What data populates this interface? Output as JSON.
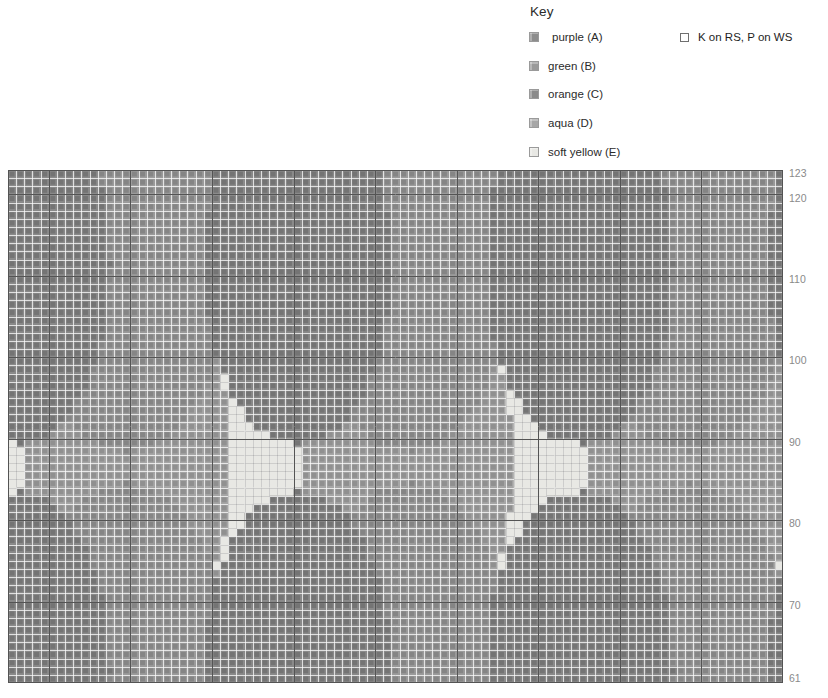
{
  "key": {
    "title": "Key",
    "colors": [
      {
        "label": "purple (A)",
        "letter": "A",
        "hex": "#8d8d8d",
        "indent": true
      },
      {
        "label": "green (B)",
        "letter": "B",
        "hex": "#9b9b9b",
        "indent": false
      },
      {
        "label": "orange (C)",
        "letter": "C",
        "hex": "#8a8a8a",
        "indent": false
      },
      {
        "label": "aqua (D)",
        "letter": "D",
        "hex": "#a6a6a6",
        "indent": false
      },
      {
        "label": "soft yellow (E)",
        "letter": "E",
        "hex": "#e8e8e4",
        "indent": false
      }
    ],
    "symbols": [
      {
        "label": "K on RS, P on WS",
        "glyph": "empty-square"
      }
    ]
  },
  "chart_data": {
    "type": "heatmap",
    "title": "",
    "xlabel": "",
    "ylabel": "",
    "grid": true,
    "legend_position": "top-right",
    "columns": 95,
    "rows": 63,
    "row_label_side": "right",
    "row_labels_visible": [
      123,
      120,
      110,
      100,
      90,
      80,
      70,
      61
    ],
    "row_top": 123,
    "row_bottom": 61,
    "bold_line_every": 10,
    "cell_px": 8.15,
    "palette": {
      "A": "#8d8d8d",
      "B": "#9b9b9b",
      "C": "#8a8a8a",
      "D": "#a6a6a6",
      "E": "#e8e8e4"
    },
    "background_letter": "A",
    "gridline_color": "#d8d8d8",
    "boldline_color": "#545454",
    "motifs": [
      {
        "letter": "E",
        "shape": "ellipse",
        "cx": 31.5,
        "cy": 111.0,
        "rx": 11.5,
        "ry": 22.5
      },
      {
        "letter": "E",
        "shape": "ellipse",
        "cx": 66.0,
        "cy": 86.5,
        "rx": 12.5,
        "ry": 23.0
      },
      {
        "letter": "E",
        "shape": "ellipse",
        "cx": 31.5,
        "cy": 60.0,
        "rx": 12.0,
        "ry": 22.5
      },
      {
        "letter": "D",
        "shape": "ellipse",
        "cx": 48.5,
        "cy": 112.0,
        "rx": 12.5,
        "ry": 23.5
      },
      {
        "letter": "D",
        "shape": "ellipse",
        "cx": 14.0,
        "cy": 87.5,
        "rx": 12.5,
        "ry": 23.0
      },
      {
        "letter": "D",
        "shape": "ellipse",
        "cx": 48.5,
        "cy": 63.0,
        "rx": 12.0,
        "ry": 22.0
      },
      {
        "letter": "B",
        "shape": "ellipse",
        "cx": 83.0,
        "cy": 112.0,
        "rx": 12.0,
        "ry": 23.0
      },
      {
        "letter": "B",
        "shape": "ellipse",
        "cx": 83.0,
        "cy": 62.0,
        "rx": 12.0,
        "ry": 22.0
      },
      {
        "letter": "C",
        "shape": "ellipse",
        "cx": 0.5,
        "cy": 112.0,
        "rx": 11.0,
        "ry": 22.0
      },
      {
        "letter": "C",
        "shape": "ellipse",
        "cx": 0.5,
        "cy": 62.0,
        "rx": 11.0,
        "ry": 22.0
      }
    ]
  }
}
